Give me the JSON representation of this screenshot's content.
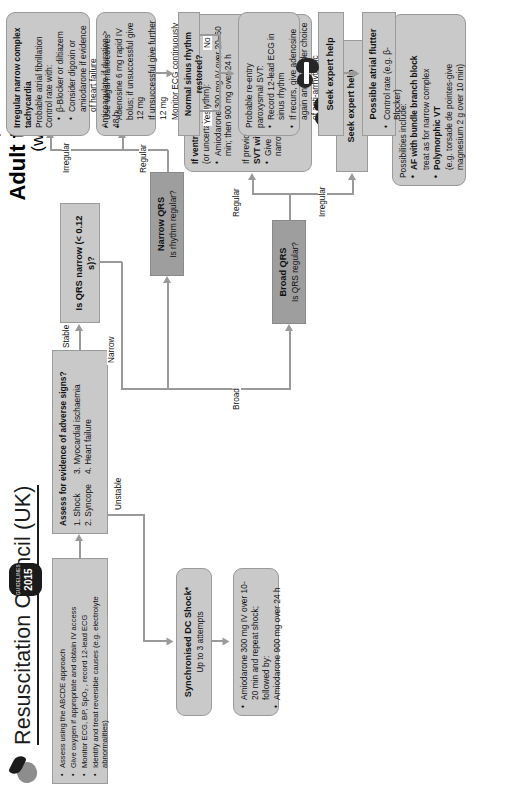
{
  "header": {
    "org": "Resuscitation Council (UK)",
    "title_line1": "Adult tachycardia",
    "title_line2": "(with pulse)",
    "badge_word": "GUIDELINES",
    "badge_year": "2015",
    "logo_name": "resuscitation-council-logo"
  },
  "assess": {
    "items": [
      "Assess using the ABCDE approach",
      "Give oxygen if appropriate and obtain IV access",
      "Monitor ECG, BP, SpO₂ , record 12-lead ECG",
      "Identify and treat reversible causes (e.g. electrolyte abnormalities)"
    ]
  },
  "adverse": {
    "title": "Assess for evidence of adverse signs?",
    "col1": [
      "1. Shock",
      "2. Syncope"
    ],
    "col2": [
      "3. Myocardial ischaemia",
      "4. Heart failure"
    ]
  },
  "branch_labels": {
    "unstable": "Unstable",
    "stable": "Stable",
    "narrow": "Narrow",
    "broad": "Broad",
    "regular": "Regular",
    "irregular": "Irregular",
    "yes": "Yes",
    "no": "No"
  },
  "dc_shock": {
    "title": "Synchronised DC Shock*",
    "sub": "Up to 3 attempts"
  },
  "amiodarone": {
    "items": [
      "Amiodarone 300 mg IV over 10-20 min and repeat shock; followed by:",
      "Amiodarone 900 mg over 24 h"
    ]
  },
  "qrs_narrow": {
    "question": "Is QRS narrow (< 0.12 s)?"
  },
  "broad_qrs": {
    "title": "Broad QRS",
    "question": "Is QRS regular?"
  },
  "narrow_qrs": {
    "title": "Narrow QRS",
    "question": "Is rhythm regular?"
  },
  "vt_box": {
    "h1": "If ventricular tachycardia",
    "h1sub": "(or uncertain rhythm):",
    "b1": "Amiodarone 300 mg IV over 20–60 min; then 900 mg over 24 h",
    "h2a": "If previously confirmed",
    "h2b": "SVT with bundle branch block:",
    "b2": "Give adenosine as for regular narrow complex tachycardia"
  },
  "seek_help_broad": {
    "label": "Seek expert help"
  },
  "possibilities": {
    "lead": "Possibilities include:",
    "i1": "AF with bundle branch block",
    "i1sub": "treat as for narrow complex",
    "i2": "Polymorphic VT",
    "i2sub": "(e.g. torsade de pointes-give magnesium 2 g over 10 min)"
  },
  "vagal": {
    "items": [
      "Use vagal manoeuvres",
      "Adenosine 6 mg rapid IV bolus; if unsuccessful give 12 mg",
      "If unsuccessful give further 12 mg",
      "Monitor ECG continuously"
    ]
  },
  "sinus": {
    "question": "Normal sinus rhythm restored?"
  },
  "svt_box": {
    "lead": "Probable re-entry paroxysmal SVT:",
    "items": [
      "Record 12-lead ECG in sinus rhythm",
      "If recurs, give adenosine again and consider choice of anti-arrhythmic prophylaxis"
    ]
  },
  "irregular_box": {
    "h1": "Irregular narrow complex tachycardia",
    "h2": "Probable atrial fibrillation",
    "h3": "Control rate with:",
    "items": [
      "β-Blocker or diltiazem",
      "Consider digoxin or amiodarone if evidence of heart failure"
    ],
    "foot": "Anticoagulate if duration > 48 h"
  },
  "seek_help_narrow": {
    "label": "Seek expert help"
  },
  "flutter": {
    "title": "Possible atrial flutter",
    "item": "Control rate (e.g. β-Blocker)"
  }
}
